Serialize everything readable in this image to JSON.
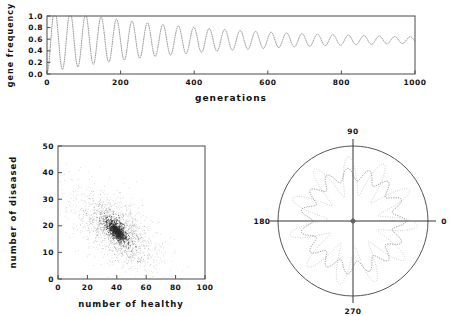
{
  "figure": {
    "panels": [
      "timeseries",
      "scatter",
      "polar"
    ]
  },
  "chart_data": [
    {
      "id": "gene-frequency-timeseries",
      "type": "line",
      "title": "",
      "xlabel": "generations",
      "ylabel": "gene frequency",
      "xlim": [
        0,
        1000
      ],
      "ylim": [
        0.0,
        1.0
      ],
      "xticks": [
        0,
        200,
        400,
        600,
        800,
        1000
      ],
      "xtick_labels": [
        "0",
        "200",
        "400",
        "600",
        "800",
        "1000"
      ],
      "yticks": [
        0.0,
        0.2,
        0.4,
        0.6,
        0.8,
        1.0
      ],
      "ytick_labels": [
        "0.0",
        "0.2",
        "0.4",
        "0.6",
        "0.8",
        "1.0"
      ],
      "grid": false,
      "legend": "none",
      "line_style": "dotted",
      "description": "Damped oscillation of gene frequency converging to equilibrium",
      "model": {
        "equilibrium": 0.585,
        "initial_value": 0.02,
        "initial_amplitude": 0.56,
        "damping_constant": 430,
        "period_generations": 42,
        "phase_offset": -1.5708
      },
      "x": [
        0,
        20,
        40,
        60,
        80,
        100,
        120,
        140,
        160,
        180,
        200,
        240,
        280,
        320,
        360,
        400,
        450,
        500,
        550,
        600,
        700,
        800,
        900,
        1000
      ],
      "y": [
        0.02,
        0.93,
        0.13,
        0.89,
        0.16,
        0.86,
        0.2,
        0.83,
        0.23,
        0.81,
        0.26,
        0.3,
        0.34,
        0.38,
        0.42,
        0.45,
        0.48,
        0.51,
        0.53,
        0.55,
        0.57,
        0.58,
        0.585,
        0.585
      ],
      "envelope_max": [
        0.95,
        0.92,
        0.89,
        0.86,
        0.83,
        0.79,
        0.75,
        0.72,
        0.69,
        0.67,
        0.65,
        0.63,
        0.62,
        0.61,
        0.6,
        0.595,
        0.59
      ],
      "envelope_min": [
        0.03,
        0.11,
        0.17,
        0.23,
        0.28,
        0.33,
        0.38,
        0.42,
        0.46,
        0.49,
        0.51,
        0.53,
        0.55,
        0.56,
        0.57,
        0.575,
        0.58
      ]
    },
    {
      "id": "healthy-vs-diseased-scatter",
      "type": "scatter",
      "title": "",
      "xlabel": "number of healthy",
      "ylabel": "number of diseased",
      "xlim": [
        0,
        100
      ],
      "ylim": [
        0,
        50
      ],
      "xticks": [
        0,
        20,
        40,
        60,
        80,
        100
      ],
      "xtick_labels": [
        "0",
        "20",
        "40",
        "60",
        "80",
        "100"
      ],
      "yticks": [
        0,
        10,
        20,
        30,
        40,
        50
      ],
      "ytick_labels": [
        "0",
        "10",
        "20",
        "30",
        "40",
        "50"
      ],
      "grid": false,
      "legend": "none",
      "marker": "dot",
      "description": "Phase-space point cloud with a dense elongated core near (40,18) and a diffuse negatively correlated halo",
      "cluster": {
        "center_x": 40,
        "center_y": 18,
        "core_sigma_x": 3.5,
        "core_sigma_y": 2.2,
        "halo_sigma_x": 16,
        "halo_sigma_y": 8,
        "correlation": -0.62,
        "n_points": 1900
      }
    },
    {
      "id": "polar-rosette",
      "type": "line",
      "projection": "polar",
      "title": "",
      "xlabel": "",
      "ylabel": "",
      "theta_ticks": [
        0,
        90,
        180,
        270
      ],
      "theta_tick_labels": [
        "0",
        "90",
        "180",
        "270"
      ],
      "rmax": 1.0,
      "grid": false,
      "legend": "none",
      "description": "Two overlapping multi-lobed rosette curves inside a bounding circle",
      "series": [
        {
          "name": "inner-scalloped",
          "style": "dashed",
          "r_mean": 0.62,
          "r_amplitude": 0.085,
          "lobes": 15,
          "phase": 0.0
        },
        {
          "name": "outer-petals",
          "style": "dotted",
          "r_mean": 0.6,
          "r_amplitude": 0.26,
          "lobes": 11,
          "phase": 0.25
        }
      ]
    }
  ]
}
